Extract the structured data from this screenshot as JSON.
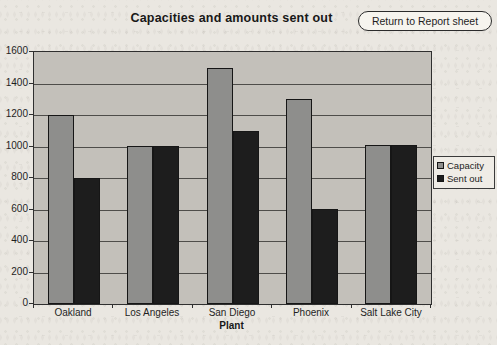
{
  "button": {
    "label": "Return to Report sheet"
  },
  "chart_data": {
    "type": "bar",
    "title": "Capacities and amounts sent out",
    "categories": [
      "Oakland",
      "Los Angeles",
      "San Diego",
      "Phoenix",
      "Salt Lake City"
    ],
    "series": [
      {
        "name": "Capacity",
        "color": "#8e8e8c",
        "values": [
          1200,
          1000,
          1500,
          1300,
          1010
        ]
      },
      {
        "name": "Sent out",
        "color": "#1d1d1d",
        "values": [
          800,
          1000,
          1100,
          600,
          1010
        ]
      }
    ],
    "xlabel": "Plant",
    "ylabel": "",
    "ylim": [
      0,
      1600
    ],
    "ytick_interval": 200,
    "ytick_labels": [
      "1600",
      "1400",
      "1200",
      "1000",
      "800",
      "600",
      "400",
      "200",
      "0"
    ],
    "grid": true,
    "legend_position": "right",
    "plot_background": "#c3c0ba"
  }
}
